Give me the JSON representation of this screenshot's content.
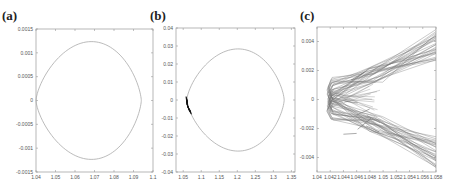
{
  "chart_data": [
    {
      "type": "line",
      "panel_label": "(a)",
      "title": "",
      "xlabel": "",
      "ylabel": "",
      "xlim": [
        1.04,
        1.1
      ],
      "ylim": [
        -0.0015,
        0.0015
      ],
      "xticks": [
        1.04,
        1.05,
        1.06,
        1.07,
        1.08,
        1.09,
        1.1
      ],
      "xtick_labels": [
        "1.04",
        "1.05",
        "1.06",
        "1.07",
        "1.08",
        "1.09",
        "1.1"
      ],
      "yticks": [
        0.0015,
        0.001,
        0.0005,
        0,
        -0.0005,
        -0.001,
        -0.0015
      ],
      "ytick_labels": [
        "0.0015",
        "0.001",
        "0.0005",
        "0",
        "-0.0005",
        "-0.001",
        "-0.0015"
      ],
      "grid": false,
      "series": [
        {
          "name": "closed orbit",
          "color": "#aaaaaa",
          "shape": "teardrop",
          "tip": [
            1.04,
            0
          ],
          "apex": [
            1.077,
            0.00135
          ],
          "right_extent": 1.094
        }
      ]
    },
    {
      "type": "line",
      "panel_label": "(b)",
      "title": "",
      "xlabel": "",
      "ylabel": "",
      "xlim": [
        1.03,
        1.36
      ],
      "ylim": [
        -0.04,
        0.04
      ],
      "xticks": [
        1.05,
        1.1,
        1.15,
        1.2,
        1.25,
        1.3,
        1.35
      ],
      "xtick_labels": [
        "1.05",
        "1.1",
        "1.15",
        "1.2",
        "1.25",
        "1.3",
        "1.35"
      ],
      "yticks": [
        0.04,
        0.03,
        0.02,
        0.01,
        0,
        -0.01,
        -0.02,
        -0.03,
        -0.04
      ],
      "ytick_labels": [
        "0.04",
        "0.03",
        "0.02",
        "0.01",
        "0",
        "-0.01",
        "-0.02",
        "-0.03",
        "-0.04"
      ],
      "grid": false,
      "series": [
        {
          "name": "closed orbit",
          "color": "#aaaaaa",
          "shape": "teardrop",
          "tip": [
            1.06,
            0
          ],
          "apex": [
            1.245,
            0.031
          ],
          "right_extent": 1.33
        },
        {
          "name": "tip cluster",
          "color": "#111111",
          "shape": "dense-segment",
          "points": [
            [
              1.058,
              0.002
            ],
            [
              1.06,
              -0.002
            ],
            [
              1.064,
              -0.004
            ],
            [
              1.07,
              -0.006
            ]
          ]
        }
      ]
    },
    {
      "type": "line",
      "panel_label": "(c)",
      "title": "",
      "xlabel": "",
      "ylabel": "",
      "xlim": [
        1.04,
        1.058
      ],
      "ylim": [
        -0.005,
        0.005
      ],
      "xticks": [
        1.04,
        1.042,
        1.044,
        1.046,
        1.048,
        1.05,
        1.052,
        1.054,
        1.056,
        1.058
      ],
      "xtick_labels": [
        "1.04",
        "1.042",
        "1.044",
        "1.046",
        "1.048",
        "1.05",
        "1.052",
        "1.054",
        "1.056",
        "1.058"
      ],
      "yticks": [
        0.004,
        0.002,
        0,
        -0.002,
        -0.004
      ],
      "ytick_labels": [
        "0.004",
        "0.002",
        "0",
        "-0.002",
        "-0.004"
      ],
      "grid": false,
      "series": [
        {
          "name": "trajectory bundle",
          "color": "#777777",
          "shape": "v-bundle",
          "tip_x": 1.0415,
          "tip_halfwidth_y": 0.0009,
          "upper_end": [
            1.058,
            0.0048
          ],
          "lower_end": [
            1.058,
            -0.0048
          ],
          "inner_notch_x": 1.0488,
          "strands": 28
        }
      ]
    }
  ]
}
